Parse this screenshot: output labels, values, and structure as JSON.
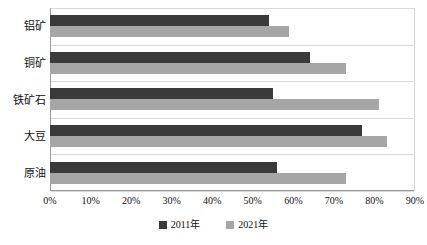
{
  "chart_data": {
    "type": "bar",
    "orientation": "horizontal",
    "title": "",
    "xlabel": "",
    "ylabel": "",
    "categories": [
      "铝矿",
      "铜矿",
      "铁矿石",
      "大豆",
      "原油"
    ],
    "series": [
      {
        "name": "2011年",
        "color": "#3a3a3a",
        "values": [
          54,
          64,
          55,
          77,
          56
        ]
      },
      {
        "name": "2021年",
        "color": "#a6a6a6",
        "values": [
          59,
          73,
          81,
          83,
          73
        ]
      }
    ],
    "xlim": [
      0,
      90
    ],
    "xticks": [
      0,
      10,
      20,
      30,
      40,
      50,
      60,
      70,
      80,
      90
    ],
    "xtick_labels": [
      "0%",
      "10%",
      "20%",
      "30%",
      "40%",
      "50%",
      "60%",
      "70%",
      "80%",
      "90%"
    ],
    "grid": true,
    "grid_axis": "y-category",
    "legend_position": "bottom"
  },
  "legend": {
    "entries": [
      {
        "label": "2011年",
        "color": "#3a3a3a"
      },
      {
        "label": "2021年",
        "color": "#a6a6a6"
      }
    ]
  },
  "colors": {
    "series_2011": "#3a3a3a",
    "series_2021": "#a6a6a6",
    "axis_line": "#9b9b9b",
    "gridline": "#d9d9d9",
    "background": "#ffffff"
  }
}
